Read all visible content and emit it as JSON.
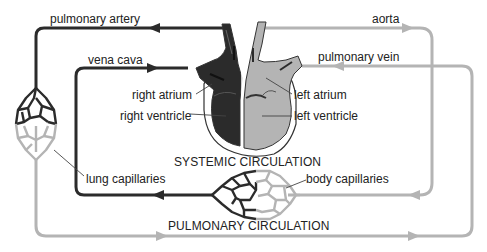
{
  "diagram": {
    "type": "circulatory-system",
    "colors": {
      "deoxygenated": "#2b2b2b",
      "oxygenated": "#b4b4b4",
      "outline": "#333333",
      "text": "#222222",
      "background": "#ffffff"
    },
    "labels": {
      "pulmonary_artery": "pulmonary artery",
      "vena_cava": "vena cava",
      "aorta": "aorta",
      "pulmonary_vein": "pulmonary vein",
      "right_atrium": "right atrium",
      "right_ventricle": "right ventricle",
      "left_atrium": "left atrium",
      "left_ventricle": "left ventricle",
      "lung_capillaries": "lung capillaries",
      "body_capillaries": "body capillaries",
      "systemic_circulation": "SYSTEMIC CIRCULATION",
      "pulmonary_circulation": "PULMONARY CIRCULATION"
    },
    "nodes": [
      {
        "id": "heart",
        "parts": [
          "right atrium",
          "right ventricle",
          "left atrium",
          "left ventricle"
        ]
      },
      {
        "id": "lung-capillaries"
      },
      {
        "id": "body-capillaries"
      }
    ],
    "edges": [
      {
        "from": "heart",
        "to": "lung-capillaries",
        "label": "pulmonary artery",
        "blood": "deoxygenated"
      },
      {
        "from": "lung-capillaries",
        "to": "heart",
        "label": "pulmonary vein",
        "blood": "oxygenated"
      },
      {
        "from": "heart",
        "to": "body-capillaries",
        "label": "aorta",
        "blood": "oxygenated"
      },
      {
        "from": "body-capillaries",
        "to": "heart",
        "label": "vena cava",
        "blood": "deoxygenated"
      }
    ]
  }
}
